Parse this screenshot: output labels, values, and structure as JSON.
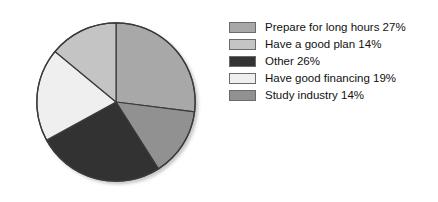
{
  "chart_data": {
    "type": "pie",
    "title": "",
    "labels": [
      "Prepare for long hours",
      "Have a good plan",
      "Other",
      "Have good financing",
      "Study industry"
    ],
    "values": [
      27,
      14,
      26,
      19,
      14
    ],
    "value_suffix": "%",
    "colors": [
      "#a8a8a8",
      "#c4c4c4",
      "#333333",
      "#efefef",
      "#919191"
    ],
    "slice_order_clockwise_from_top": [
      "Prepare for long hours",
      "Study industry",
      "Other",
      "Have good financing",
      "Have a good plan"
    ],
    "legend_position": "right",
    "grid": false,
    "slice_border_color": "#3a3a3a",
    "legend": [
      {
        "label": "Prepare for long hours 27%",
        "color": "#a8a8a8",
        "value": 27,
        "name": "Prepare for long hours"
      },
      {
        "label": "Have a good plan 14%",
        "color": "#c4c4c4",
        "value": 14,
        "name": "Have a good plan"
      },
      {
        "label": "Other 26%",
        "color": "#333333",
        "value": 26,
        "name": "Other"
      },
      {
        "label": "Have good financing 19%",
        "color": "#efefef",
        "value": 19,
        "name": "Have good financing"
      },
      {
        "label": "Study industry 14%",
        "color": "#919191",
        "value": 14,
        "name": "Study industry"
      }
    ]
  }
}
